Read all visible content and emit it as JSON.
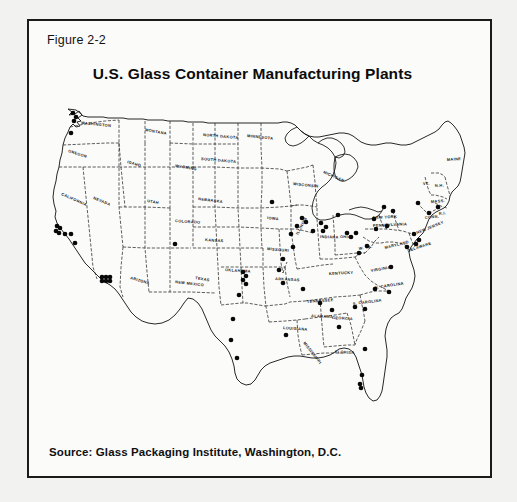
{
  "figure": {
    "label": "Figure 2-2",
    "title": "U.S. Glass Container Manufacturing Plants",
    "source": "Source: Glass Packaging Institute, Washington, D.C."
  },
  "map": {
    "name": "united-states-map",
    "description": "Outline map of the contiguous United States with state boundaries and filled dots marking glass container manufacturing plant locations.",
    "dot_marker_meaning": "glass container manufacturing plant",
    "state_labels": [
      "WASHINGTON",
      "OREGON",
      "CALIFORNIA",
      "NEVADA",
      "IDAHO",
      "MONTANA",
      "WYOMING",
      "UTAH",
      "ARIZONA",
      "COLORADO",
      "NEW MEXICO",
      "NORTH DAKOTA",
      "SOUTH DAKOTA",
      "NEBRASKA",
      "KANSAS",
      "OKLAHOMA",
      "TEXAS",
      "MINNESOTA",
      "IOWA",
      "MISSOURI",
      "ARKANSAS",
      "LOUISIANA",
      "WISCONSIN",
      "MICHIGAN",
      "ILLINOIS",
      "INDIANA",
      "OHIO",
      "KENTUCKY",
      "TENNESSEE",
      "MISSISSIPPI",
      "ALABAMA",
      "GEORGIA",
      "FLORIDA",
      "S. CAROLINA",
      "N. CAROLINA",
      "VIRGINIA",
      "W. VA.",
      "MARYLAND",
      "DELAWARE",
      "PENNSYLVANIA",
      "NEW YORK",
      "NEW JERSEY",
      "CONN.",
      "R.I.",
      "MASS.",
      "VT.",
      "N.H.",
      "MAINE"
    ],
    "colors": {
      "frame": "#1a1a1a",
      "dot": "#080808",
      "border": "#2a2a2a",
      "page_background": "#f2f2f0",
      "panel_background": "#fbfbfa"
    },
    "plant_dots": [
      {
        "region": "Washington - Puget Sound",
        "x": 38,
        "y": 6
      },
      {
        "region": "Washington - Seattle",
        "x": 41,
        "y": 10
      },
      {
        "region": "Washington - Tacoma",
        "x": 39,
        "y": 14
      },
      {
        "region": "Oregon - Portland",
        "x": 36,
        "y": 26
      },
      {
        "region": "California - San Francisco Bay",
        "x": 22,
        "y": 119
      },
      {
        "region": "California - Oakland",
        "x": 25,
        "y": 121
      },
      {
        "region": "California - Bay Area",
        "x": 21,
        "y": 124
      },
      {
        "region": "California - Bay Area 2",
        "x": 24,
        "y": 126
      },
      {
        "region": "California - San Jose",
        "x": 30,
        "y": 127
      },
      {
        "region": "California - Modesto",
        "x": 36,
        "y": 127
      },
      {
        "region": "California - Fresno",
        "x": 40,
        "y": 136
      },
      {
        "region": "California - Los Angeles",
        "x": 67,
        "y": 170
      },
      {
        "region": "California - LA 2",
        "x": 71,
        "y": 170
      },
      {
        "region": "California - LA 3",
        "x": 75,
        "y": 170
      },
      {
        "region": "California - LA 4",
        "x": 67,
        "y": 174
      },
      {
        "region": "California - LA 5",
        "x": 71,
        "y": 174
      },
      {
        "region": "California - LA 6",
        "x": 75,
        "y": 174
      },
      {
        "region": "Colorado - Denver",
        "x": 140,
        "y": 137
      },
      {
        "region": "Oklahoma - Tulsa",
        "x": 208,
        "y": 165
      },
      {
        "region": "Oklahoma - Tulsa 2",
        "x": 211,
        "y": 169
      },
      {
        "region": "Oklahoma - Okmulgee",
        "x": 208,
        "y": 173
      },
      {
        "region": "Oklahoma - Henryetta",
        "x": 211,
        "y": 177
      },
      {
        "region": "Oklahoma - Ada",
        "x": 204,
        "y": 188
      },
      {
        "region": "Texas - Waco",
        "x": 198,
        "y": 212
      },
      {
        "region": "Texas - Houston",
        "x": 196,
        "y": 233
      },
      {
        "region": "Texas - Houston 2",
        "x": 202,
        "y": 251
      },
      {
        "region": "Arkansas - Jonesboro",
        "x": 248,
        "y": 176
      },
      {
        "region": "Louisiana - Baton Rouge",
        "x": 251,
        "y": 228
      },
      {
        "region": "Iowa - Burlington",
        "x": 237,
        "y": 95
      },
      {
        "region": "Illinois - Chicago",
        "x": 267,
        "y": 111
      },
      {
        "region": "Illinois - Chicago 2",
        "x": 271,
        "y": 115
      },
      {
        "region": "Illinois - Streator",
        "x": 262,
        "y": 119
      },
      {
        "region": "Illinois - Peoria",
        "x": 256,
        "y": 127
      },
      {
        "region": "Illinois - Lincoln",
        "x": 258,
        "y": 140
      },
      {
        "region": "Illinois - Alton",
        "x": 248,
        "y": 152
      },
      {
        "region": "Missouri - St. Louis",
        "x": 244,
        "y": 163
      },
      {
        "region": "Indiana - Gas City",
        "x": 286,
        "y": 116
      },
      {
        "region": "Indiana - Muncie",
        "x": 291,
        "y": 120
      },
      {
        "region": "Indiana - Dunkirk",
        "x": 288,
        "y": 124
      },
      {
        "region": "Indiana - Terre Haute",
        "x": 278,
        "y": 124
      },
      {
        "region": "Ohio - Toledo",
        "x": 303,
        "y": 108
      },
      {
        "region": "Ohio - Columbus",
        "x": 312,
        "y": 126
      },
      {
        "region": "Ohio - Lancaster",
        "x": 316,
        "y": 130
      },
      {
        "region": "Ohio - Zanesville",
        "x": 321,
        "y": 126
      },
      {
        "region": "Pennsylvania - Pittsburgh",
        "x": 341,
        "y": 122
      },
      {
        "region": "Pennsylvania - Clarion",
        "x": 339,
        "y": 112
      },
      {
        "region": "Pennsylvania - Central",
        "x": 352,
        "y": 119
      },
      {
        "region": "New York - Buffalo",
        "x": 349,
        "y": 100
      },
      {
        "region": "New York - Elmira",
        "x": 358,
        "y": 104
      },
      {
        "region": "New York - Albany",
        "x": 383,
        "y": 96
      },
      {
        "region": "Pennsylvania - Philadelphia",
        "x": 379,
        "y": 127
      },
      {
        "region": "New Jersey - Millville",
        "x": 384,
        "y": 133
      },
      {
        "region": "New Jersey - Bridgeton",
        "x": 381,
        "y": 137
      },
      {
        "region": "Maryland - Baltimore",
        "x": 372,
        "y": 140
      },
      {
        "region": "Massachusetts - Boston",
        "x": 403,
        "y": 100
      },
      {
        "region": "Connecticut - Hartford",
        "x": 394,
        "y": 106
      },
      {
        "region": "W. Virginia - Clarksburg",
        "x": 332,
        "y": 139
      },
      {
        "region": "W. Virginia - Huntington",
        "x": 324,
        "y": 146
      },
      {
        "region": "Virginia - Richmond",
        "x": 356,
        "y": 160
      },
      {
        "region": "N. Carolina - Wilson",
        "x": 354,
        "y": 185
      },
      {
        "region": "N. Carolina - Henderson",
        "x": 340,
        "y": 182
      },
      {
        "region": "S. Carolina - Laurens",
        "x": 320,
        "y": 200
      },
      {
        "region": "S. Carolina - Aiken",
        "x": 330,
        "y": 202
      },
      {
        "region": "Georgia - Atlanta",
        "x": 297,
        "y": 203
      },
      {
        "region": "Georgia - Macon",
        "x": 304,
        "y": 220
      },
      {
        "region": "Alabama - Birmingham",
        "x": 285,
        "y": 196
      },
      {
        "region": "Tennessee - Memphis",
        "x": 268,
        "y": 182
      },
      {
        "region": "Florida - Jacksonville",
        "x": 330,
        "y": 242
      },
      {
        "region": "Florida - Tampa",
        "x": 327,
        "y": 268
      },
      {
        "region": "Florida - Tampa 2",
        "x": 325,
        "y": 277
      },
      {
        "region": "Florida - Sarasota",
        "x": 326,
        "y": 281
      }
    ]
  }
}
